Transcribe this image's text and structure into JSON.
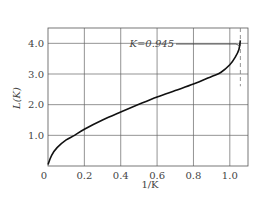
{
  "chart_data": {
    "type": "line",
    "title": "",
    "xlabel": "1/K",
    "ylabel": "L(K)",
    "xlim": [
      0,
      1.1
    ],
    "ylim": [
      0,
      4.5
    ],
    "grid": true,
    "x_ticks": [
      "0",
      "0.2",
      "0.4",
      "0.6",
      "0.8",
      "1.0"
    ],
    "y_ticks": [
      "1.0",
      "2.0",
      "3.0",
      "4.0"
    ],
    "x_tick_values": [
      0,
      0.2,
      0.4,
      0.6,
      0.8,
      1.0
    ],
    "y_tick_values": [
      1.0,
      2.0,
      3.0,
      4.0
    ],
    "series": [
      {
        "name": "L(K)",
        "x": [
          0,
          0.02,
          0.05,
          0.1,
          0.146,
          0.2,
          0.3,
          0.4,
          0.5,
          0.6,
          0.7,
          0.8,
          0.9,
          0.95,
          1.0,
          1.03,
          1.05,
          1.058
        ],
        "y": [
          0.05,
          0.35,
          0.6,
          0.85,
          1.0,
          1.2,
          1.5,
          1.76,
          2.01,
          2.25,
          2.46,
          2.67,
          2.92,
          3.05,
          3.3,
          3.55,
          3.8,
          4.1
        ]
      }
    ],
    "annotations": [
      {
        "text": "K=0.945",
        "points_to": {
          "x": 1.058,
          "y": 4.0
        }
      }
    ],
    "reference_lines": [
      {
        "orientation": "vertical",
        "x": 1.058,
        "style": "dashed"
      }
    ]
  },
  "labels": {
    "xlabel": "1/K",
    "ylabel": "L(K)",
    "annotation": "K=0.945",
    "origin": "0"
  },
  "colors": {
    "curve": "#111111",
    "grid": "#555555",
    "text": "#444444"
  }
}
